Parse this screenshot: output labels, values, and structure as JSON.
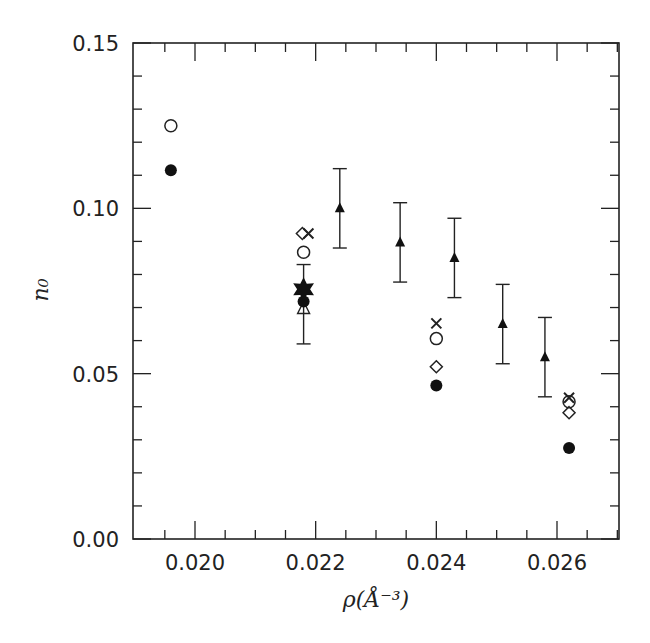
{
  "chart_data": {
    "type": "scatter",
    "title": "",
    "xlabel": "ρ(Å⁻³)",
    "ylabel": "n₀",
    "xlim": [
      0.0193,
      0.0271
    ],
    "ylim": [
      0.0,
      0.15
    ],
    "grid": false,
    "legend": "none",
    "x_ticks": [
      0.02,
      0.022,
      0.024,
      0.026
    ],
    "x_tick_labels": [
      "0.020",
      "0.022",
      "0.024",
      "0.026"
    ],
    "x_minor_step": 0.0005,
    "y_ticks": [
      0.0,
      0.05,
      0.1,
      0.15
    ],
    "y_tick_labels": [
      "0.00",
      "0.05",
      "0.10",
      "0.15"
    ],
    "y_minor_step": 0.01,
    "series": [
      {
        "name": "open-circles",
        "marker": "circle-open",
        "points": [
          [
            0.0196,
            0.125
          ],
          [
            0.0218,
            0.0867
          ],
          [
            0.024,
            0.0606
          ],
          [
            0.0262,
            0.0415
          ]
        ]
      },
      {
        "name": "filled-circles",
        "marker": "circle-filled",
        "points": [
          [
            0.0196,
            0.1115
          ],
          [
            0.0218,
            0.0718
          ],
          [
            0.024,
            0.0464
          ],
          [
            0.0262,
            0.0275
          ]
        ]
      },
      {
        "name": "diamonds",
        "marker": "diamond-open",
        "points": [
          [
            0.02178,
            0.0924
          ],
          [
            0.024,
            0.0521
          ],
          [
            0.0262,
            0.0382
          ]
        ]
      },
      {
        "name": "crosses",
        "marker": "cross",
        "points": [
          [
            0.02188,
            0.0924
          ],
          [
            0.024,
            0.0652
          ],
          [
            0.0262,
            0.0427
          ]
        ]
      },
      {
        "name": "triangles-with-errors",
        "marker": "triangle-filled",
        "points": [
          [
            0.0224,
            0.1
          ],
          [
            0.0234,
            0.0897
          ],
          [
            0.0243,
            0.085
          ],
          [
            0.0251,
            0.065
          ],
          [
            0.0258,
            0.055
          ]
        ],
        "errors": [
          0.012,
          0.012,
          0.012,
          0.012,
          0.012
        ]
      },
      {
        "name": "star",
        "marker": "star-filled",
        "points": [
          [
            0.0218,
            0.0755
          ]
        ],
        "error_range": [
          [
            0.059,
            0.083
          ]
        ]
      },
      {
        "name": "open-triangle",
        "marker": "triangle-open",
        "points": [
          [
            0.0218,
            0.0697
          ]
        ]
      }
    ]
  }
}
